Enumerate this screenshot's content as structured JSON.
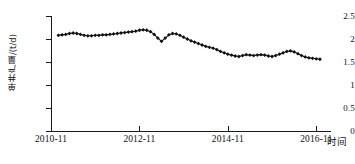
{
  "chart_data": {
    "type": "line",
    "title": "",
    "subtitle": "",
    "xlabel": "时间",
    "ylabel": "单井产量/(t/d)",
    "ylim": [
      0,
      2.5
    ],
    "y_ticks": [
      "0",
      "0.5",
      "1",
      "1.5",
      "2",
      "2.5"
    ],
    "y_tick_values": [
      0,
      0.5,
      1,
      1.5,
      2,
      2.5
    ],
    "x_ticks": [
      "2010-11",
      "2012-11",
      "2014-11",
      "2016-11"
    ],
    "x_tick_values": [
      0,
      24,
      48,
      72
    ],
    "xlim": [
      0,
      76
    ],
    "grid": false,
    "legend": null,
    "marker": "filled-diamond",
    "marker_color": "#111111",
    "line_color": "#111111",
    "series": [
      {
        "name": "单井产量",
        "x": [
          2,
          3,
          4,
          5,
          6,
          7,
          8,
          9,
          10,
          11,
          12,
          13,
          14,
          15,
          16,
          17,
          18,
          19,
          20,
          21,
          22,
          23,
          24,
          25,
          26,
          27,
          28,
          29,
          30,
          31,
          32,
          33,
          34,
          35,
          36,
          37,
          38,
          39,
          40,
          41,
          42,
          43,
          44,
          45,
          46,
          47,
          48,
          49,
          50,
          51,
          52,
          53,
          54,
          55,
          56,
          57,
          58,
          59,
          60,
          61,
          62,
          63,
          64,
          65,
          66,
          67,
          68,
          69,
          70,
          71,
          72,
          73
        ],
        "values": [
          2.08,
          2.09,
          2.1,
          2.12,
          2.13,
          2.12,
          2.1,
          2.08,
          2.07,
          2.07,
          2.08,
          2.08,
          2.09,
          2.09,
          2.1,
          2.11,
          2.12,
          2.13,
          2.14,
          2.15,
          2.16,
          2.17,
          2.19,
          2.2,
          2.19,
          2.16,
          2.1,
          2.02,
          1.95,
          2.02,
          2.09,
          2.12,
          2.11,
          2.08,
          2.04,
          2.0,
          1.96,
          1.93,
          1.9,
          1.87,
          1.84,
          1.82,
          1.8,
          1.77,
          1.73,
          1.7,
          1.67,
          1.65,
          1.63,
          1.62,
          1.64,
          1.66,
          1.65,
          1.64,
          1.65,
          1.66,
          1.65,
          1.63,
          1.62,
          1.64,
          1.67,
          1.7,
          1.73,
          1.74,
          1.72,
          1.68,
          1.64,
          1.61,
          1.59,
          1.58,
          1.57,
          1.56
        ]
      }
    ]
  },
  "axis": {
    "y_title": "单井产量/(t/d)",
    "x_title": "时间"
  }
}
